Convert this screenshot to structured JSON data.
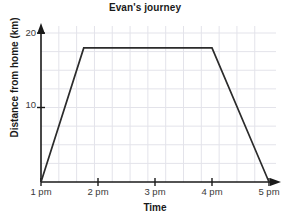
{
  "chart_data": {
    "type": "line",
    "title": "Evan's journey",
    "xlabel": "Time",
    "ylabel": "Distance from home (km)",
    "x_tick_labels": [
      "1 pm",
      "2 pm",
      "3 pm",
      "4 pm",
      "5 pm"
    ],
    "x_tick_values": [
      1,
      2,
      3,
      4,
      5
    ],
    "y_tick_labels": [
      "10",
      "20"
    ],
    "y_tick_values": [
      10,
      20
    ],
    "xlim": [
      1,
      5
    ],
    "ylim": [
      0,
      21
    ],
    "grid": true,
    "grid_x_step": 0.3125,
    "grid_y_step": 2.5,
    "legend": "none",
    "series": [
      {
        "name": "Evan's distance from home",
        "x": [
          1,
          1.75,
          4,
          5
        ],
        "y": [
          0,
          18,
          18,
          0
        ],
        "points": [
          {
            "time": "1 pm",
            "distance_km": 0
          },
          {
            "time": "1:45 pm",
            "distance_km": 18
          },
          {
            "time": "4 pm",
            "distance_km": 18
          },
          {
            "time": "5 pm",
            "distance_km": 0
          }
        ]
      }
    ],
    "colors": {
      "line": "#2b2b2b",
      "axis": "#1a1a1a",
      "grid": "#e3e3ea",
      "tick_text": "#3a3a3a",
      "title_text": "#1a1a1a",
      "background": "#ffffff"
    }
  }
}
